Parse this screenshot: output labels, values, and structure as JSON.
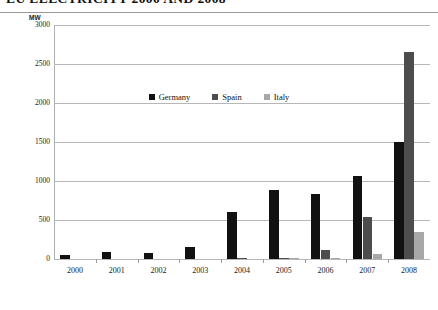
{
  "title": "EU ELECTRICITY 2000 AND 2008",
  "chart": {
    "y_axis_unit": "MW",
    "legend_position": "inside-top-center"
  },
  "chart_data": {
    "type": "bar",
    "title": "EU ELECTRICITY 2000 AND 2008",
    "xlabel": "",
    "ylabel": "MW",
    "ylim": [
      0,
      3000
    ],
    "yticks": [
      0,
      500,
      1000,
      1500,
      2000,
      2500,
      3000
    ],
    "ytick_labels": [
      "0",
      "500",
      "1000",
      "1500",
      "2000",
      "2500",
      "3000"
    ],
    "grid": true,
    "categories": [
      "2000",
      "2001",
      "2002",
      "2003",
      "2004",
      "2005",
      "2006",
      "2007",
      "2008"
    ],
    "series": [
      {
        "name": "Germany",
        "color": "#111111",
        "values": [
          50,
          90,
          80,
          150,
          600,
          880,
          830,
          1070,
          1500
        ]
      },
      {
        "name": "Spain",
        "color": "#4d4d4d",
        "values": [
          0,
          0,
          0,
          0,
          10,
          15,
          110,
          540,
          2650
        ]
      },
      {
        "name": "Italy",
        "color": "#a8a8a8",
        "values": [
          0,
          0,
          0,
          0,
          0,
          5,
          8,
          70,
          340
        ]
      }
    ]
  }
}
